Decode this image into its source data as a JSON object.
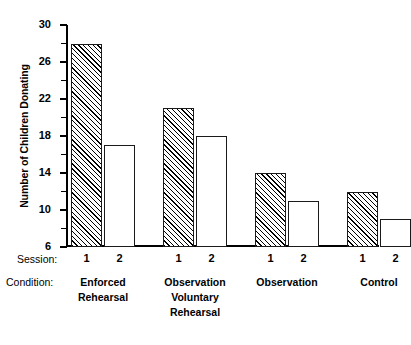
{
  "chart_data": {
    "type": "bar",
    "title": "",
    "xlabel": "Condition",
    "ylabel": "Number of Children Donating",
    "ylim": [
      6,
      30
    ],
    "y_major_ticks": [
      6,
      10,
      14,
      18,
      22,
      26,
      30
    ],
    "y_minor_ticks": [
      8,
      12,
      16,
      20,
      24,
      28
    ],
    "grid": false,
    "legend": "none",
    "group_axis_label": "Condition:",
    "series_axis_label": "Session:",
    "categories": [
      "Enforced\nRehearsal",
      "Observation\nVoluntary\nRehearsal",
      "Observation",
      "Control"
    ],
    "series": [
      {
        "name": "1",
        "fill": "hatched",
        "values": [
          28,
          21,
          14,
          12
        ]
      },
      {
        "name": "2",
        "fill": "open",
        "values": [
          17,
          18,
          11,
          9
        ]
      }
    ],
    "bars": [
      {
        "group": "Enforced Rehearsal",
        "session": "1",
        "value": 28,
        "fill": "hatched"
      },
      {
        "group": "Enforced Rehearsal",
        "session": "2",
        "value": 17,
        "fill": "open"
      },
      {
        "group": "Observation Voluntary Rehearsal",
        "session": "1",
        "value": 21,
        "fill": "hatched"
      },
      {
        "group": "Observation Voluntary Rehearsal",
        "session": "2",
        "value": 18,
        "fill": "open"
      },
      {
        "group": "Observation",
        "session": "1",
        "value": 14,
        "fill": "hatched"
      },
      {
        "group": "Observation",
        "session": "2",
        "value": 11,
        "fill": "open"
      },
      {
        "group": "Control",
        "session": "1",
        "value": 12,
        "fill": "hatched"
      },
      {
        "group": "Control",
        "session": "2",
        "value": 9,
        "fill": "open"
      }
    ],
    "colors": {
      "axis": "#000000",
      "bar_outline": "#1a1a1a",
      "bar_open_fill": "#ffffff",
      "bar_hatch": "#000000",
      "background": "#ffffff"
    }
  },
  "axis": {
    "ylabel": "Number of Children Donating",
    "ticks": [
      {
        "value": "30"
      },
      {
        "value": "26"
      },
      {
        "value": "22"
      },
      {
        "value": "18"
      },
      {
        "value": "14"
      },
      {
        "value": "10"
      },
      {
        "value": "6"
      }
    ]
  },
  "session_row": {
    "title": "Session:",
    "marks": [
      "1",
      "2",
      "1",
      "2",
      "1",
      "2",
      "1",
      "2"
    ]
  },
  "condition_row": {
    "title": "Condition:",
    "labels": [
      "Enforced\nRehearsal",
      "Observation\nVoluntary\nRehearsal",
      "Observation",
      "Control"
    ]
  }
}
